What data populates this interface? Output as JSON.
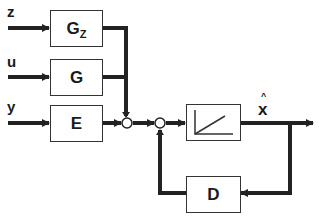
{
  "diagram": {
    "type": "block-diagram",
    "inputs": [
      {
        "id": "z",
        "label": "z"
      },
      {
        "id": "u",
        "label": "u"
      },
      {
        "id": "y",
        "label": "y"
      }
    ],
    "blocks": [
      {
        "id": "gz",
        "label": "G",
        "subscript": "Z"
      },
      {
        "id": "g",
        "label": "G"
      },
      {
        "id": "e",
        "label": "E"
      },
      {
        "id": "integrator",
        "label": "",
        "icon": "ramp-integrator-icon"
      },
      {
        "id": "d",
        "label": "D"
      }
    ],
    "output": {
      "label": "x",
      "hat": "^"
    },
    "summing_junctions": 2,
    "line_color": "#222222"
  }
}
